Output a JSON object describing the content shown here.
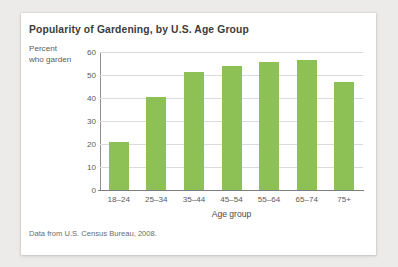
{
  "figure": {
    "title": "Popularity of Gardening, by U.S. Age Group",
    "source_note": "Data from U.S. Census Bureau, 2008.",
    "y_axis_label_line1": "Percent",
    "y_axis_label_line2": "who garden"
  },
  "colors": {
    "bar": "#8dc055",
    "gridline": "#dddbd9",
    "axis": "#7d7d7d",
    "title_text": "#3b3b3b",
    "body_text": "#5b5b5b",
    "card_background": "#ffffff",
    "page_background": "#edebe9"
  },
  "chart_data": {
    "type": "bar",
    "title": "Popularity of Gardening, by U.S. Age Group",
    "xlabel": "Age group",
    "ylabel": "Percent who garden",
    "categories": [
      "18–24",
      "25–34",
      "35–44",
      "45–54",
      "55–64",
      "65–74",
      "75+"
    ],
    "values": [
      21,
      40.5,
      51.5,
      54,
      55.5,
      56.5,
      47
    ],
    "ylim": [
      0,
      60
    ],
    "yticks": [
      0,
      10,
      20,
      30,
      40,
      50,
      60
    ],
    "ytick_labels": [
      "0",
      "10",
      "20",
      "30",
      "40",
      "50",
      "60"
    ],
    "grid": "horizontal",
    "legend": "none",
    "source": "Data from U.S. Census Bureau, 2008."
  }
}
